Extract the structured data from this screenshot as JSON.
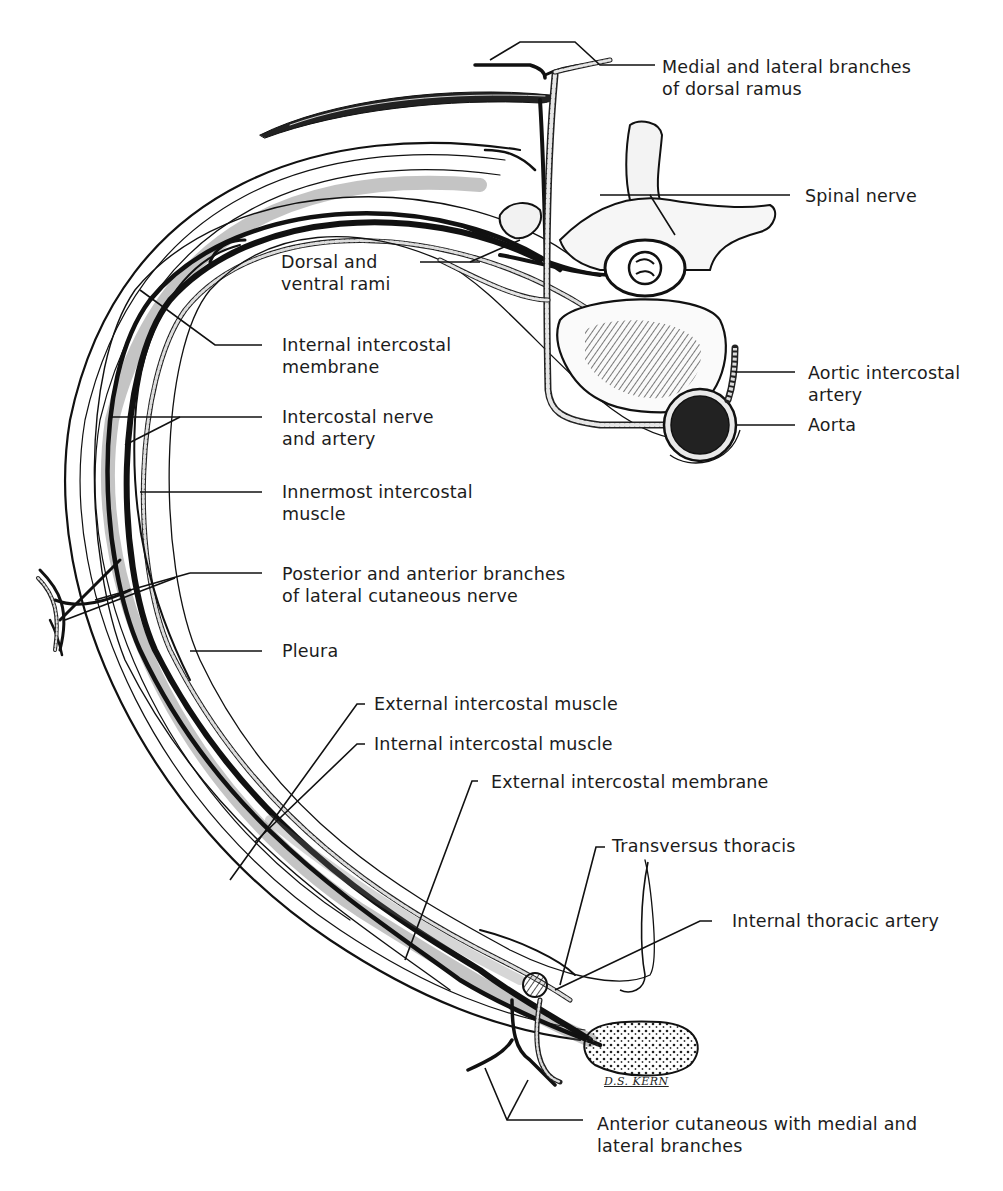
{
  "figure": {
    "signature": "D.S. KERN"
  },
  "labels": {
    "medial_lateral_dorsal": [
      "Medial and lateral branches",
      "of dorsal ramus"
    ],
    "spinal_nerve": [
      "Spinal nerve"
    ],
    "dorsal_ventral_rami": [
      "Dorsal and",
      "ventral rami"
    ],
    "internal_intercostal_membrane": [
      "Internal intercostal",
      "membrane"
    ],
    "aortic_intercostal_artery": [
      "Aortic intercostal",
      "artery"
    ],
    "aorta": [
      "Aorta"
    ],
    "intercostal_nerve_artery": [
      "Intercostal nerve",
      "and artery"
    ],
    "innermost_intercostal_muscle": [
      "Innermost intercostal",
      "muscle"
    ],
    "lateral_cutaneous_branches": [
      "Posterior and anterior branches",
      "of lateral cutaneous nerve"
    ],
    "pleura": [
      "Pleura"
    ],
    "external_intercostal_muscle": [
      "External intercostal muscle"
    ],
    "internal_intercostal_muscle": [
      "Internal intercostal muscle"
    ],
    "external_intercostal_membrane": [
      "External intercostal membrane"
    ],
    "transversus_thoracis": [
      "Transversus thoracis"
    ],
    "internal_thoracic_artery": [
      "Internal thoracic artery"
    ],
    "anterior_cutaneous": [
      "Anterior cutaneous with medial and",
      "lateral branches"
    ]
  }
}
